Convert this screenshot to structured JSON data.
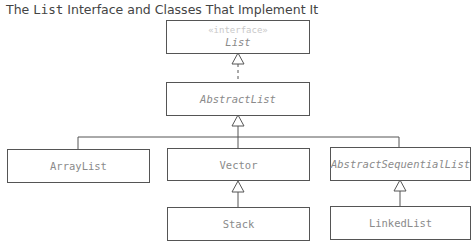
{
  "title": {
    "prefix": "The ",
    "code": "List",
    "suffix": " Interface and Classes That Implement It"
  },
  "nodes": {
    "list": {
      "stereotype": "«interface»",
      "name": "List",
      "kind": "interface"
    },
    "abstract_list": {
      "name": "AbstractList",
      "kind": "abstract"
    },
    "array_list": {
      "name": "ArrayList",
      "kind": "class"
    },
    "vector": {
      "name": "Vector",
      "kind": "class"
    },
    "abstract_sequential_list": {
      "name": "AbstractSequentialList",
      "kind": "abstract"
    },
    "stack": {
      "name": "Stack",
      "kind": "class"
    },
    "linked_list": {
      "name": "LinkedList",
      "kind": "class"
    }
  },
  "edges": [
    {
      "from": "AbstractList",
      "to": "List",
      "type": "realization (dashed, hollow triangle)"
    },
    {
      "from": "ArrayList",
      "to": "AbstractList",
      "type": "generalization"
    },
    {
      "from": "Vector",
      "to": "AbstractList",
      "type": "generalization"
    },
    {
      "from": "AbstractSequentialList",
      "to": "AbstractList",
      "type": "generalization"
    },
    {
      "from": "Stack",
      "to": "Vector",
      "type": "generalization"
    },
    {
      "from": "LinkedList",
      "to": "AbstractSequentialList",
      "type": "generalization"
    }
  ]
}
